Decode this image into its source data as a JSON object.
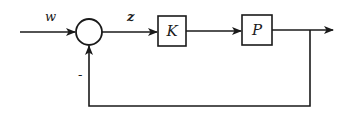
{
  "diagram": {
    "type": "feedback-control-block-diagram",
    "signals": {
      "input": "w",
      "error": "z",
      "feedback_sign": "-"
    },
    "blocks": [
      {
        "id": "controller",
        "label": "K"
      },
      {
        "id": "plant",
        "label": "P"
      }
    ],
    "summing_junction": {
      "inputs": [
        "w",
        "feedback"
      ],
      "signs": [
        "+",
        "-"
      ]
    },
    "colors": {
      "stroke": "#1a1a1a",
      "background": "#ffffff"
    }
  }
}
